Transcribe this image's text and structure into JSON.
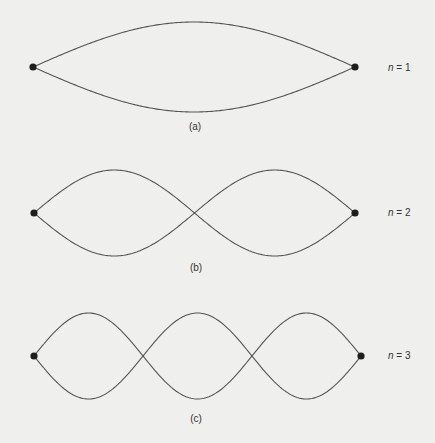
{
  "diagram": {
    "panels": [
      {
        "id": "a",
        "caption": "(a)",
        "n_var": "n",
        "n_eq": " = 1",
        "n": 1,
        "x0": 33,
        "x1": 355,
        "cy": 67,
        "amp": 45,
        "caption_y": 121,
        "label_y": 67
      },
      {
        "id": "b",
        "caption": "(b)",
        "n_var": "n",
        "n_eq": " = 2",
        "n": 2,
        "x0": 34,
        "x1": 355,
        "cy": 213,
        "amp": 43,
        "caption_y": 262,
        "label_y": 212
      },
      {
        "id": "c",
        "caption": "(c)",
        "n_var": "n",
        "n_eq": " = 3",
        "n": 3,
        "x0": 34,
        "x1": 361,
        "cy": 356,
        "amp": 43,
        "caption_y": 413,
        "label_y": 355
      }
    ],
    "colors": {
      "background": "#efefed",
      "line": "#555555",
      "node": "#1e1e1e",
      "text": "#333333"
    }
  }
}
